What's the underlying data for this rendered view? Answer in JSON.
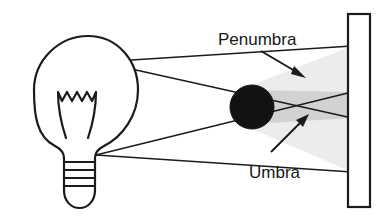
{
  "figure": {
    "background_color": "#ffffff",
    "ink_color": "#1b1b1b"
  },
  "labels": {
    "penumbra": "Penumbra",
    "umbra": "Umbra"
  },
  "colors": {
    "outline": "#1b1b1b",
    "occluder_fill": "#121212",
    "penumbra_fill": "#ececec",
    "umbra_fill": "#d2d2d2",
    "wall_fill": "#ffffff",
    "bulb_fill": "#ffffff"
  },
  "elements": {
    "light_source": {
      "name": "light-bulb",
      "glass_center_x": 86,
      "glass_center_y": 92,
      "glass_radius_x": 52,
      "glass_radius_y": 56,
      "emitter_top_x": 100,
      "emitter_top_y": 62,
      "emitter_bottom_x": 96,
      "emitter_bottom_y": 155,
      "base_rings": 4
    },
    "occluder": {
      "name": "sphere-occluder",
      "center_x": 252,
      "center_y": 107,
      "radius": 22
    },
    "wall": {
      "name": "projection-wall",
      "x": 348,
      "y": 14,
      "width": 22,
      "height": 193
    },
    "rays": [
      {
        "name": "ray-top-upper",
        "x1": 100,
        "y1": 62,
        "x2": 352,
        "y2": 46
      },
      {
        "name": "ray-top-lower",
        "x1": 100,
        "y1": 62,
        "x2": 352,
        "y2": 118
      },
      {
        "name": "ray-bottom-upper",
        "x1": 96,
        "y1": 155,
        "x2": 352,
        "y2": 92
      },
      {
        "name": "ray-bottom-lower",
        "x1": 96,
        "y1": 155,
        "x2": 352,
        "y2": 172
      }
    ],
    "penumbra_region": {
      "name": "penumbra-shading"
    },
    "umbra_region": {
      "name": "umbra-shading"
    },
    "penumbra_pointer": {
      "name": "penumbra-arrow",
      "x1": 261,
      "y1": 51,
      "x2": 303,
      "y2": 76
    },
    "umbra_pointer": {
      "name": "umbra-arrow",
      "x1": 271,
      "y1": 152,
      "x2": 306,
      "y2": 117
    }
  },
  "text_positions": {
    "penumbra_x": 218,
    "penumbra_y": 45,
    "umbra_x": 249,
    "umbra_y": 178
  }
}
